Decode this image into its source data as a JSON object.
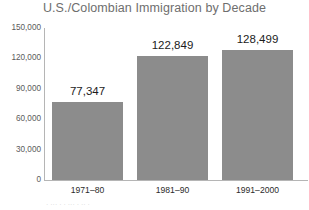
{
  "chart_data": {
    "type": "bar",
    "title": "U.S./Colombian Immigration by Decade",
    "xlabel": "",
    "ylabel": "",
    "categories": [
      "1971–80",
      "1981–90",
      "1991–2000"
    ],
    "values": [
      77347,
      122849,
      128499
    ],
    "value_labels": [
      "77,347",
      "122,849",
      "128,499"
    ],
    "ylim": [
      0,
      150000
    ],
    "yticks": [
      0,
      30000,
      60000,
      90000,
      120000,
      150000
    ],
    "ytick_labels": [
      "0",
      "30,000",
      "60,000",
      "90,000",
      "120,000",
      "150,000"
    ],
    "grid": false,
    "legend": null,
    "bar_color": "#8c8c8c",
    "axis_color": "#b5b5b5",
    "title_color": "#6e6e6e"
  },
  "figure": {
    "bottom_caption": "· ··· · · ··· · ·· ·"
  }
}
